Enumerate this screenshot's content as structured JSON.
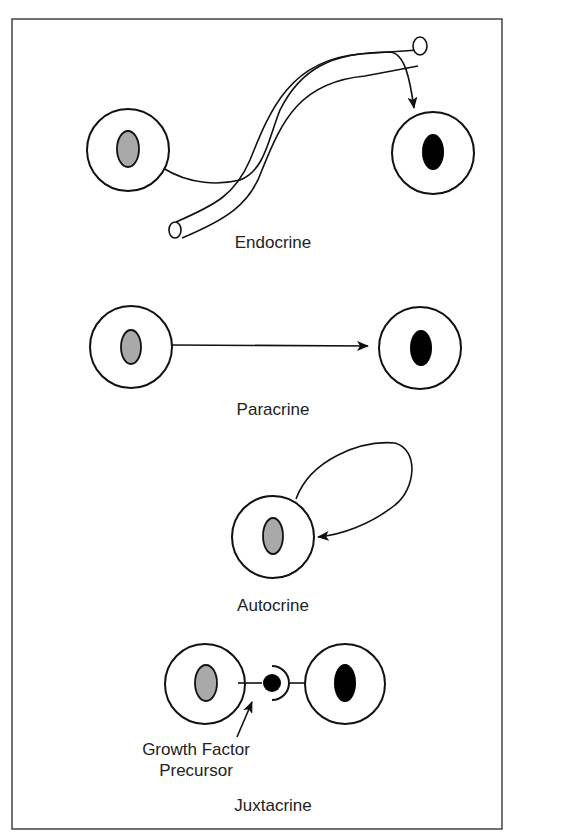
{
  "figure": {
    "panels": [
      {
        "id": "endocrine",
        "label": "Endocrine"
      },
      {
        "id": "paracrine",
        "label": "Paracrine"
      },
      {
        "id": "autocrine",
        "label": "Autocrine"
      },
      {
        "id": "juxtacrine",
        "label": "Juxtacrine",
        "annotation_line1": "Growth Factor",
        "annotation_line2": "Precursor"
      }
    ],
    "colors": {
      "source_nucleus": "#a9a9a9",
      "target_nucleus": "#000000",
      "stroke": "#111111",
      "frame": "#444444"
    }
  }
}
